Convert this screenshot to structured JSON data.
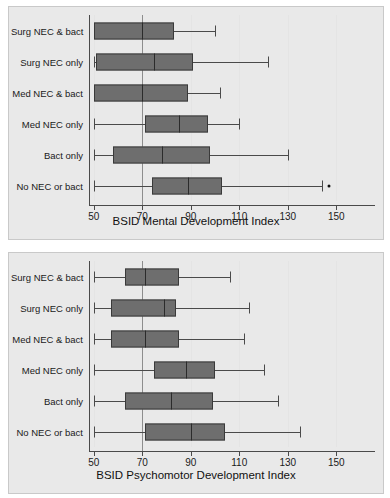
{
  "figure": {
    "categories": [
      "Surg NEC & bact",
      "Surg NEC only",
      "Med NEC & bact",
      "Med NEC only",
      "Bact only",
      "No NEC or bact"
    ],
    "reference_line": 70
  },
  "chart_data": [
    {
      "type": "box",
      "title": "",
      "xlabel": "BSID Mental Development Index",
      "ylabel": "",
      "xlim": [
        48,
        166
      ],
      "ticks": [
        50,
        70,
        90,
        110,
        130,
        150
      ],
      "tick_labels": [
        "50",
        "70",
        "90",
        "110",
        "130",
        "150"
      ],
      "grid": true,
      "reference_line": 70,
      "orientation": "horizontal",
      "categories": [
        "Surg NEC & bact",
        "Surg NEC only",
        "Med NEC & bact",
        "Med NEC only",
        "Bact only",
        "No NEC or bact"
      ],
      "boxes": [
        {
          "category": "Surg NEC & bact",
          "whisker_low": 50,
          "q1": 50,
          "median": 70,
          "q3": 83,
          "whisker_high": 100,
          "outliers": [],
          "low_cap": false
        },
        {
          "category": "Surg NEC only",
          "whisker_low": 50,
          "q1": 51,
          "median": 75,
          "q3": 91,
          "whisker_high": 122,
          "outliers": [],
          "low_cap": true
        },
        {
          "category": "Med NEC & bact",
          "whisker_low": 50,
          "q1": 50,
          "median": 70,
          "q3": 89,
          "whisker_high": 102,
          "outliers": [],
          "low_cap": false
        },
        {
          "category": "Med NEC only",
          "whisker_low": 50,
          "q1": 71,
          "median": 85,
          "q3": 97,
          "whisker_high": 110,
          "outliers": [],
          "low_cap": true
        },
        {
          "category": "Bact only",
          "whisker_low": 50,
          "q1": 58,
          "median": 78,
          "q3": 98,
          "whisker_high": 130,
          "outliers": [],
          "low_cap": true
        },
        {
          "category": "No NEC or bact",
          "whisker_low": 50,
          "q1": 74,
          "median": 89,
          "q3": 103,
          "whisker_high": 144,
          "outliers": [
            147
          ],
          "low_cap": true
        }
      ]
    },
    {
      "type": "box",
      "title": "",
      "xlabel": "BSID Psychomotor Development Index",
      "ylabel": "",
      "xlim": [
        48,
        166
      ],
      "ticks": [
        50,
        70,
        90,
        110,
        130,
        150
      ],
      "tick_labels": [
        "50",
        "70",
        "90",
        "110",
        "130",
        "150"
      ],
      "grid": true,
      "reference_line": 70,
      "orientation": "horizontal",
      "categories": [
        "Surg NEC & bact",
        "Surg NEC only",
        "Med NEC & bact",
        "Med NEC only",
        "Bact only",
        "No NEC or bact"
      ],
      "boxes": [
        {
          "category": "Surg NEC & bact",
          "whisker_low": 50,
          "q1": 63,
          "median": 71,
          "q3": 85,
          "whisker_high": 106,
          "outliers": [],
          "low_cap": true
        },
        {
          "category": "Surg NEC only",
          "whisker_low": 50,
          "q1": 57,
          "median": 79,
          "q3": 84,
          "whisker_high": 114,
          "outliers": [],
          "low_cap": true
        },
        {
          "category": "Med NEC & bact",
          "whisker_low": 50,
          "q1": 57,
          "median": 71,
          "q3": 85,
          "whisker_high": 112,
          "outliers": [],
          "low_cap": true
        },
        {
          "category": "Med NEC only",
          "whisker_low": 50,
          "q1": 75,
          "median": 88,
          "q3": 100,
          "whisker_high": 120,
          "outliers": [],
          "low_cap": true
        },
        {
          "category": "Bact only",
          "whisker_low": 50,
          "q1": 63,
          "median": 82,
          "q3": 99,
          "whisker_high": 126,
          "outliers": [],
          "low_cap": true
        },
        {
          "category": "No NEC or bact",
          "whisker_low": 50,
          "q1": 71,
          "median": 90,
          "q3": 104,
          "whisker_high": 135,
          "outliers": [],
          "low_cap": true
        }
      ]
    }
  ]
}
